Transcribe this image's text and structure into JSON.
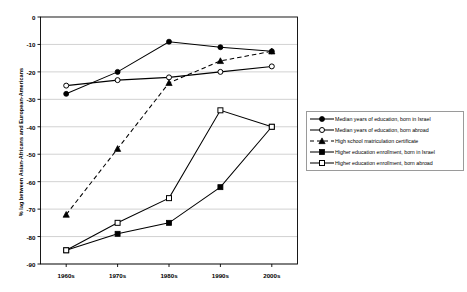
{
  "chart_data": {
    "type": "line",
    "title": "",
    "xlabel": "",
    "ylabel": "% lag between Asian-Africans and European-Americans",
    "categories": [
      "1960s",
      "1970s",
      "1980s",
      "1990s",
      "2000s"
    ],
    "ylim": [
      -90,
      0
    ],
    "ytick_labels": [
      "0",
      "-10",
      "-20",
      "-30",
      "-40",
      "-50",
      "-60",
      "-70",
      "-80",
      "-90"
    ],
    "ytick_values": [
      0,
      -10,
      -20,
      -30,
      -40,
      -50,
      -60,
      -70,
      -80,
      -90
    ],
    "grid": true,
    "legend_position": "right",
    "series": [
      {
        "name": "Median years of education, born in Israel",
        "marker": "filled-circle",
        "line": "solid",
        "values": [
          -28,
          -20,
          -9,
          -11,
          -12.5
        ]
      },
      {
        "name": "Median years of education, born abroad",
        "marker": "open-circle",
        "line": "solid",
        "values": [
          -25,
          -23,
          -22,
          -20,
          -18
        ]
      },
      {
        "name": "High school matriculation certificate",
        "marker": "filled-triangle",
        "line": "dashed",
        "values": [
          -72,
          -48,
          -24,
          -16,
          -12.5
        ]
      },
      {
        "name": "Higher education enrollment, born in Israel",
        "marker": "filled-square",
        "line": "solid",
        "values": [
          -85,
          -79,
          -75,
          -62,
          -40
        ]
      },
      {
        "name": "Higher education enrollment, born abroad",
        "marker": "open-square",
        "line": "solid",
        "values": [
          -85,
          -75,
          -66,
          -34,
          -40
        ]
      }
    ]
  },
  "colors": {
    "line": "#000000",
    "grid": "#bfbfbf",
    "frame": "#000000",
    "background": "#ffffff"
  }
}
